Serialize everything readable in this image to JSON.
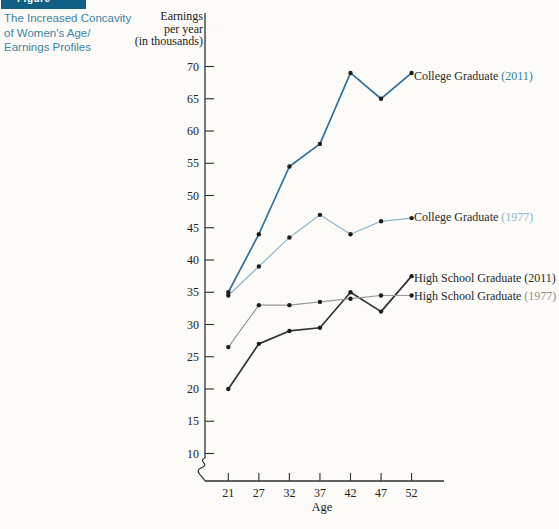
{
  "figure_box": {
    "label": "Figure",
    "color": "#115f85"
  },
  "caption": {
    "lines": [
      "The Increased Concavity",
      "of Women's Age/",
      "Earnings Profiles"
    ],
    "color": "#3e84a4"
  },
  "chart_data": {
    "type": "line",
    "title": "",
    "xlabel": "Age",
    "ylabel_lines": [
      "Earnings",
      "per year",
      "(in thousands)"
    ],
    "x_categories": [
      "21",
      "27",
      "32",
      "37",
      "42",
      "47",
      "52"
    ],
    "y_ticks": [
      10,
      15,
      20,
      25,
      30,
      35,
      40,
      45,
      50,
      55,
      60,
      65,
      70
    ],
    "ylim": [
      10,
      70
    ],
    "y_axis_break": true,
    "grid": false,
    "legend_position": "right-of-line-ends",
    "axis_color": "#2f2f2f",
    "text_color": "#222222",
    "point_color": "#1d1d1d",
    "series": [
      {
        "name": "College Graduate (2011)",
        "legend_text": "College Graduate ",
        "legend_year": "(2011)",
        "color": "#34719f",
        "year_color": "#2f7fa2",
        "width": 1.7,
        "values": [
          35,
          44,
          54.5,
          58,
          69,
          65,
          69
        ]
      },
      {
        "name": "College Graduate (1977)",
        "legend_text": "College Graduate ",
        "legend_year": "(1977)",
        "color": "#8db5c9",
        "year_color": "#93b7c9",
        "width": 1.2,
        "values": [
          34.5,
          39,
          43.5,
          47,
          44,
          46,
          46.5
        ]
      },
      {
        "name": "High School Graduate (2011)",
        "legend_text": "High School Graduate ",
        "legend_year": "(2011)",
        "color": "#333333",
        "year_color": "#2a2a2a",
        "width": 1.7,
        "values": [
          20,
          27,
          29,
          29.5,
          35,
          32,
          37.5
        ]
      },
      {
        "name": "High School Graduate (1977)",
        "legend_text": "High School Graduate ",
        "legend_year": "(1977)",
        "color": "#9a9a9a",
        "year_color": "#8f8f8f",
        "width": 1.2,
        "values": [
          26.5,
          33,
          33,
          33.5,
          34,
          34.5,
          34.5
        ]
      }
    ]
  }
}
